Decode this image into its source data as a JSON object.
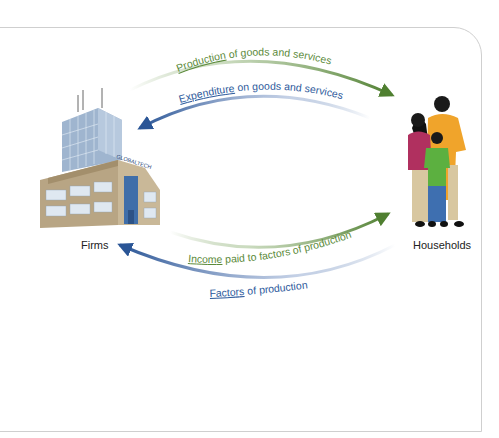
{
  "diagram": {
    "type": "circular-flow",
    "nodes": {
      "firms": {
        "label": "Firms",
        "sign": "GLOBALTECH"
      },
      "households": {
        "label": "Households"
      }
    },
    "flows": [
      {
        "id": "production",
        "keyword": "Production",
        "rest": " of goods and services",
        "from": "Firms",
        "to": "Households",
        "color": "#5b8a3a"
      },
      {
        "id": "expenditure",
        "keyword": "Expenditure",
        "rest": " on goods and services",
        "from": "Households",
        "to": "Firms",
        "color": "#2e5a9c"
      },
      {
        "id": "income",
        "keyword": "Income",
        "rest": " paid to factors of production",
        "from": "Firms",
        "to": "Households",
        "color": "#5b8a3a"
      },
      {
        "id": "factors",
        "keyword": "Factors",
        "rest": " of production",
        "from": "Households",
        "to": "Firms",
        "color": "#2e5a9c"
      }
    ],
    "colors": {
      "green": "#5b8a3a",
      "blue": "#2e5a9c",
      "frame": "#cfcfcf"
    }
  }
}
